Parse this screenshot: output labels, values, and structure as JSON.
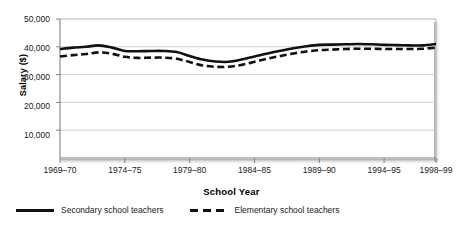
{
  "chart_data": {
    "type": "line",
    "title": "",
    "xlabel": "School Year",
    "ylabel": "Salary ($)",
    "ylim": [
      0,
      50000
    ],
    "ytick_labels": [
      "50,000",
      "40,000",
      "30,000",
      "20,000",
      "10,000"
    ],
    "ytick_values": [
      50000,
      40000,
      30000,
      20000,
      10000
    ],
    "xtick_labels": [
      "1969–70",
      "1974–75",
      "1979–80",
      "1984–85",
      "1989–90",
      "1994–95",
      "1998–99"
    ],
    "xtick_values": [
      1969,
      1974,
      1979,
      1984,
      1989,
      1994,
      1998
    ],
    "x": [
      1969,
      1970,
      1971,
      1972,
      1973,
      1974,
      1975,
      1976,
      1977,
      1978,
      1979,
      1980,
      1981,
      1982,
      1983,
      1984,
      1985,
      1986,
      1987,
      1988,
      1989,
      1990,
      1991,
      1992,
      1993,
      1994,
      1995,
      1996,
      1997,
      1998
    ],
    "grid": true,
    "legend_position": "below",
    "series": [
      {
        "name": "Secondary school teachers",
        "style": "solid",
        "color": "#111111",
        "values": [
          39200,
          39700,
          40000,
          40500,
          39700,
          38500,
          38400,
          38500,
          38500,
          38100,
          36700,
          35400,
          34700,
          34600,
          35400,
          36500,
          37600,
          38600,
          39500,
          40200,
          40700,
          40800,
          40900,
          41000,
          40900,
          40700,
          40600,
          40500,
          40500,
          41000
        ]
      },
      {
        "name": "Elementary school teachers",
        "style": "dashed",
        "color": "#111111",
        "values": [
          36500,
          37000,
          37400,
          38000,
          37500,
          36400,
          36000,
          36100,
          36100,
          35700,
          34500,
          33300,
          32800,
          32800,
          33500,
          34600,
          35700,
          36700,
          37600,
          38300,
          38800,
          39000,
          39200,
          39300,
          39300,
          39200,
          39200,
          39200,
          39300,
          39700
        ]
      }
    ]
  },
  "legend": {
    "items": [
      {
        "label": "Secondary school teachers",
        "style": "solid"
      },
      {
        "label": "Elementary school teachers",
        "style": "dashed"
      }
    ]
  }
}
